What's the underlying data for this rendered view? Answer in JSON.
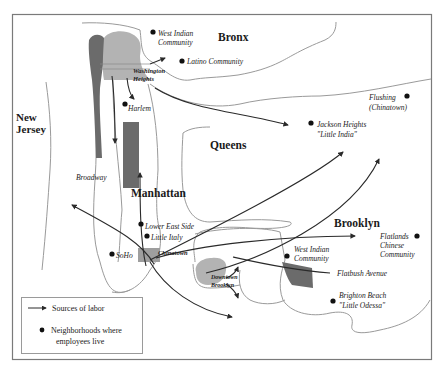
{
  "map": {
    "regions": {
      "bronx": "Bronx",
      "new_jersey_line1": "New",
      "new_jersey_line2": "Jersey",
      "queens": "Queens",
      "manhattan": "Manhattan",
      "brooklyn": "Brooklyn"
    },
    "neighborhoods": {
      "west_indian_bronx_1": "West Indian",
      "west_indian_bronx_2": "Community",
      "latino": "Latino Community",
      "washington_heights_1": "Washington",
      "washington_heights_2": "Heights",
      "harlem": "Harlem",
      "flushing_1": "Flushing",
      "flushing_2": "(Chinatown)",
      "jackson_heights_1": "Jackson Heights",
      "jackson_heights_2": "\"Little India\"",
      "broadway": "Broadway",
      "lower_east_side": "Lower East Side",
      "little_italy": "Little Italy",
      "soho": "SoHo",
      "chinatown": "Chinatown",
      "downtown_brooklyn_1": "Downtown",
      "downtown_brooklyn_2": "Brooklyn",
      "west_indian_brooklyn_1": "West Indian",
      "west_indian_brooklyn_2": "Community",
      "flatlands_1": "Flatlands",
      "flatlands_2": "Chinese",
      "flatlands_3": "Community",
      "flatbush_avenue": "Flatbush Avenue",
      "brighton_beach_1": "Brighton Beach",
      "brighton_beach_2": "\"Little Odessa\""
    },
    "legend": {
      "sources_of_labor": "Sources of labor",
      "neighborhoods_line1": "Neighborhoods where",
      "neighborhoods_line2": "employees live"
    },
    "colors": {
      "frame": "#7a7a7a",
      "coast": "#9a9a9a",
      "dark_fill": "#6b6b6b",
      "light_fill": "#b3b3b3",
      "flow": "#2a2a2a",
      "dot": "#111111"
    }
  }
}
